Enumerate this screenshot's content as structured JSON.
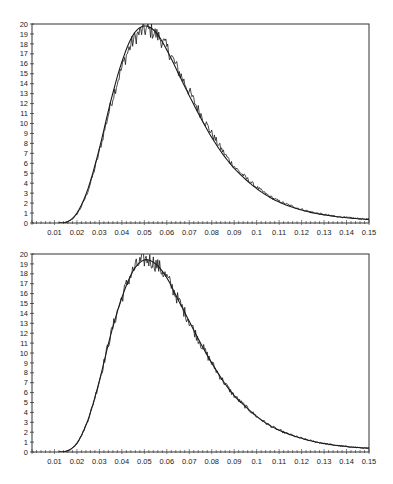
{
  "chart_data": [
    {
      "type": "line",
      "title": "",
      "xlabel": "",
      "ylabel": "",
      "xlim": [
        0,
        0.15
      ],
      "ylim": [
        0,
        20
      ],
      "grid": false,
      "legend": "none",
      "x_ticks": [
        "0.01",
        "0.02",
        "0.03",
        "0.04",
        "0.05",
        "0.06",
        "0.07",
        "0.08",
        "0.09",
        "0.1",
        "0.11",
        "0.12",
        "0.13",
        "0.14",
        "0.15"
      ],
      "y_ticks": [
        "0",
        "1",
        "2",
        "3",
        "4",
        "5",
        "6",
        "7",
        "8",
        "9",
        "10",
        "11",
        "12",
        "13",
        "14",
        "15",
        "16",
        "17",
        "18",
        "19",
        "20"
      ],
      "x": [
        0.0,
        0.01,
        0.015,
        0.02,
        0.025,
        0.03,
        0.035,
        0.04,
        0.045,
        0.05,
        0.055,
        0.06,
        0.065,
        0.07,
        0.075,
        0.08,
        0.085,
        0.09,
        0.095,
        0.1,
        0.105,
        0.11,
        0.115,
        0.12,
        0.125,
        0.13,
        0.135,
        0.14,
        0.145,
        0.15
      ],
      "series": [
        {
          "name": "fitted density",
          "style": "smooth",
          "values": [
            0,
            0,
            0.05,
            1.0,
            3.5,
            7.5,
            12.2,
            16.2,
            18.9,
            19.8,
            19.2,
            17.4,
            15.1,
            12.8,
            10.6,
            8.6,
            6.9,
            5.5,
            4.4,
            3.45,
            2.7,
            2.1,
            1.65,
            1.3,
            1.02,
            0.82,
            0.66,
            0.53,
            0.43,
            0.36
          ]
        },
        {
          "name": "empirical density",
          "style": "noisy",
          "values": [
            0,
            0,
            0.05,
            0.9,
            3.3,
            7.2,
            11.8,
            15.6,
            18.3,
            19.4,
            19.0,
            17.6,
            15.4,
            13.2,
            11.0,
            9.0,
            7.2,
            5.7,
            4.6,
            3.6,
            2.8,
            2.2,
            1.75,
            1.38,
            1.08,
            0.86,
            0.68,
            0.55,
            0.45,
            0.38
          ]
        }
      ]
    },
    {
      "type": "line",
      "title": "",
      "xlabel": "",
      "ylabel": "",
      "xlim": [
        0,
        0.15
      ],
      "ylim": [
        0,
        20
      ],
      "grid": false,
      "legend": "none",
      "x_ticks": [
        "0.01",
        "0.02",
        "0.03",
        "0.04",
        "0.05",
        "0.06",
        "0.07",
        "0.08",
        "0.09",
        "0.1",
        "0.11",
        "0.12",
        "0.13",
        "0.14",
        "0.15"
      ],
      "y_ticks": [
        "0",
        "1",
        "2",
        "3",
        "4",
        "5",
        "6",
        "7",
        "8",
        "9",
        "10",
        "11",
        "12",
        "13",
        "14",
        "15",
        "16",
        "17",
        "18",
        "19",
        "20"
      ],
      "x": [
        0.0,
        0.01,
        0.015,
        0.02,
        0.025,
        0.03,
        0.035,
        0.04,
        0.045,
        0.05,
        0.055,
        0.06,
        0.065,
        0.07,
        0.075,
        0.08,
        0.085,
        0.09,
        0.095,
        0.1,
        0.105,
        0.11,
        0.115,
        0.12,
        0.125,
        0.13,
        0.135,
        0.14,
        0.145,
        0.15
      ],
      "series": [
        {
          "name": "fitted density",
          "style": "smooth",
          "values": [
            0,
            0,
            0.05,
            0.9,
            3.3,
            7.2,
            11.8,
            15.6,
            18.3,
            19.4,
            19.0,
            17.6,
            15.4,
            13.2,
            11.0,
            9.0,
            7.2,
            5.7,
            4.6,
            3.6,
            2.8,
            2.2,
            1.75,
            1.38,
            1.08,
            0.86,
            0.68,
            0.55,
            0.45,
            0.38
          ]
        },
        {
          "name": "empirical density",
          "style": "noisy",
          "values": [
            0,
            0,
            0.05,
            0.9,
            3.3,
            7.2,
            11.8,
            15.6,
            18.3,
            19.4,
            19.0,
            17.6,
            15.4,
            13.2,
            11.0,
            9.0,
            7.2,
            5.7,
            4.6,
            3.6,
            2.8,
            2.2,
            1.75,
            1.38,
            1.08,
            0.86,
            0.68,
            0.55,
            0.45,
            0.38
          ]
        }
      ]
    }
  ],
  "layout": {
    "panels": [
      {
        "left": 32,
        "top": 24,
        "right": 369,
        "bottom": 223
      },
      {
        "left": 32,
        "top": 254,
        "right": 369,
        "bottom": 452
      }
    ],
    "line_color": "#1a1a1a",
    "axis_color": "#333333"
  }
}
